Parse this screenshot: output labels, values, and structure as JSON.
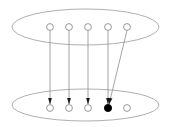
{
  "diagram": {
    "type": "set-mapping-diagram",
    "canvas": {
      "width": 171,
      "height": 127,
      "background": "#ffffff"
    },
    "colors": {
      "ellipse_stroke": "#9a9a9a",
      "edge_stroke": "#8c8c8c",
      "node_open_stroke": "#8c8c8c",
      "node_open_fill": "#ffffff",
      "node_filled_fill": "#000000",
      "arrow_fill": "#1a1a1a"
    },
    "stroke_widths": {
      "ellipse": 0.8,
      "edge": 0.8,
      "node": 0.9
    },
    "sets": [
      {
        "name": "domain-set",
        "label": "",
        "position": "top",
        "ellipse": {
          "cx": 85.5,
          "cy": 27,
          "rx": 73.5,
          "ry": 18
        },
        "nodes": [
          {
            "id": "t1",
            "label": "",
            "cx": 50,
            "cy": 27,
            "r": 3.4,
            "filled": false
          },
          {
            "id": "t2",
            "label": "",
            "cx": 69,
            "cy": 27,
            "r": 3.4,
            "filled": false
          },
          {
            "id": "t3",
            "label": "",
            "cx": 88,
            "cy": 27,
            "r": 3.4,
            "filled": false
          },
          {
            "id": "t4",
            "label": "",
            "cx": 108,
            "cy": 27,
            "r": 3.4,
            "filled": false
          },
          {
            "id": "t5",
            "label": "",
            "cx": 127,
            "cy": 27,
            "r": 3.4,
            "filled": false
          }
        ]
      },
      {
        "name": "codomain-set",
        "label": "",
        "position": "bottom",
        "ellipse": {
          "cx": 85.5,
          "cy": 105,
          "rx": 73.5,
          "ry": 16
        },
        "nodes": [
          {
            "id": "b1",
            "label": "",
            "cx": 50,
            "cy": 108,
            "r": 3.4,
            "filled": false
          },
          {
            "id": "b2",
            "label": "",
            "cx": 69,
            "cy": 108,
            "r": 3.4,
            "filled": false
          },
          {
            "id": "b3",
            "label": "",
            "cx": 88,
            "cy": 108,
            "r": 3.4,
            "filled": false
          },
          {
            "id": "b4",
            "label": "",
            "cx": 108,
            "cy": 108,
            "r": 3.6,
            "filled": true
          },
          {
            "id": "b5",
            "label": "",
            "cx": 127,
            "cy": 108,
            "r": 3.4,
            "filled": false
          }
        ]
      }
    ],
    "edges": [
      {
        "id": "e1",
        "from": "t1",
        "to": "b1",
        "x1": 50,
        "y1": 30.4,
        "x2": 50,
        "y2": 104.4,
        "arrow": true
      },
      {
        "id": "e2",
        "from": "t2",
        "to": "b2",
        "x1": 69,
        "y1": 30.4,
        "x2": 69,
        "y2": 104.4,
        "arrow": true
      },
      {
        "id": "e3",
        "from": "t3",
        "to": "b3",
        "x1": 88,
        "y1": 30.4,
        "x2": 88,
        "y2": 104.4,
        "arrow": true
      },
      {
        "id": "e4",
        "from": "t4",
        "to": "b4",
        "x1": 108,
        "y1": 30.4,
        "x2": 108,
        "y2": 104.4,
        "arrow": true
      },
      {
        "id": "e5",
        "from": "t5",
        "to": "b4",
        "x1": 127,
        "y1": 30.4,
        "x2": 109,
        "y2": 104.4,
        "arrow": true
      }
    ],
    "unmapped_nodes": [
      "b5"
    ]
  }
}
